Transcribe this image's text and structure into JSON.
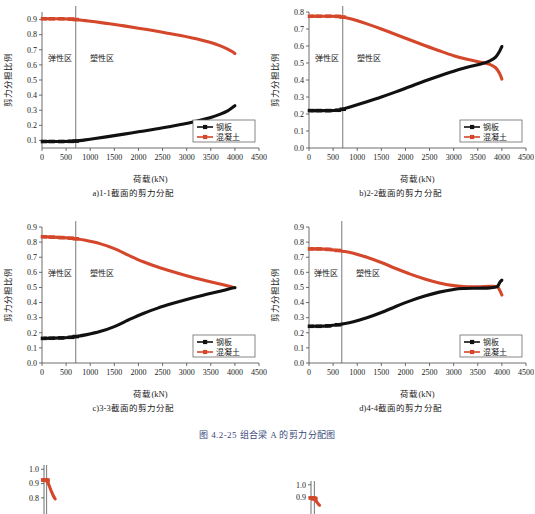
{
  "figure": {
    "caption": "图 4.2-25  组合梁 A 的剪力分配图",
    "axis": {
      "xlabel": "荷载(kN)",
      "ylabel": "剪力分担比例"
    },
    "zones": {
      "elastic": "弹性区",
      "plastic": "塑性区"
    },
    "legend": {
      "steel": "钢板",
      "concrete": "混凝土"
    },
    "colors": {
      "steel": "#111111",
      "concrete": "#D4472B",
      "axis": "#4a4a4a",
      "caption": "#3b4a7a"
    }
  },
  "chart_data": [
    {
      "id": "a",
      "type": "line",
      "title": "a)1-1截面的剪力分配",
      "xlabel": "荷载(kN)",
      "ylabel": "剪力分担比例",
      "xlim": [
        0,
        4500
      ],
      "ylim": [
        0.05,
        0.95
      ],
      "xticks": [
        0,
        500,
        1000,
        1500,
        2000,
        2500,
        3000,
        3500,
        4000,
        4500
      ],
      "yticks": [
        0.1,
        0.2,
        0.3,
        0.4,
        0.5,
        0.6,
        0.7,
        0.8,
        0.9
      ],
      "grid": false,
      "legend_position": "lower-right",
      "elastic_plastic_boundary": 700,
      "annotations": [
        "弹性区",
        "塑性区"
      ],
      "series": [
        {
          "name": "混凝土",
          "color": "#D4472B",
          "x": [
            40,
            200,
            400,
            600,
            700,
            900,
            1100,
            1400,
            1700,
            2000,
            2300,
            2600,
            2900,
            3200,
            3500,
            3700,
            3850,
            3950,
            4000
          ],
          "values": [
            0.905,
            0.905,
            0.905,
            0.903,
            0.9,
            0.893,
            0.885,
            0.872,
            0.858,
            0.843,
            0.827,
            0.81,
            0.793,
            0.773,
            0.748,
            0.726,
            0.705,
            0.687,
            0.675
          ]
        },
        {
          "name": "钢板",
          "color": "#111111",
          "x": [
            40,
            200,
            400,
            600,
            700,
            900,
            1100,
            1400,
            1700,
            2000,
            2300,
            2600,
            2900,
            3200,
            3500,
            3700,
            3850,
            3950,
            4000
          ],
          "values": [
            0.093,
            0.093,
            0.093,
            0.094,
            0.096,
            0.104,
            0.113,
            0.127,
            0.142,
            0.157,
            0.172,
            0.189,
            0.207,
            0.227,
            0.252,
            0.274,
            0.296,
            0.318,
            0.33
          ]
        }
      ]
    },
    {
      "id": "b",
      "type": "line",
      "title": "b)2-2截面的剪力分配",
      "xlabel": "荷载(kN)",
      "ylabel": "剪力分担比例",
      "xlim": [
        0,
        4500
      ],
      "ylim": [
        0.0,
        0.8
      ],
      "xticks": [
        0,
        500,
        1000,
        1500,
        2000,
        2500,
        3000,
        3500,
        4000,
        4500
      ],
      "yticks": [
        0.0,
        0.1,
        0.2,
        0.3,
        0.4,
        0.5,
        0.6,
        0.7,
        0.8
      ],
      "grid": false,
      "legend_position": "lower-right",
      "elastic_plastic_boundary": 700,
      "annotations": [
        "弹性区",
        "塑性区"
      ],
      "series": [
        {
          "name": "混凝土",
          "color": "#D4472B",
          "x": [
            40,
            200,
            400,
            600,
            700,
            900,
            1200,
            1500,
            1800,
            2100,
            2400,
            2700,
            3000,
            3300,
            3600,
            3750,
            3870,
            3950,
            4000
          ],
          "values": [
            0.775,
            0.775,
            0.775,
            0.774,
            0.77,
            0.757,
            0.73,
            0.7,
            0.668,
            0.635,
            0.603,
            0.572,
            0.543,
            0.52,
            0.503,
            0.492,
            0.472,
            0.44,
            0.405
          ]
        },
        {
          "name": "钢板",
          "color": "#111111",
          "x": [
            40,
            200,
            400,
            600,
            700,
            900,
            1200,
            1500,
            1800,
            2100,
            2400,
            2700,
            3000,
            3300,
            3600,
            3750,
            3870,
            3950,
            4000
          ],
          "values": [
            0.22,
            0.22,
            0.22,
            0.222,
            0.228,
            0.245,
            0.272,
            0.3,
            0.33,
            0.362,
            0.394,
            0.424,
            0.452,
            0.476,
            0.497,
            0.512,
            0.535,
            0.568,
            0.597
          ]
        }
      ]
    },
    {
      "id": "c",
      "type": "line",
      "title": "c)3-3截面的剪力分配",
      "xlabel": "荷载(kN)",
      "ylabel": "剪力分担比例",
      "xlim": [
        0,
        4500
      ],
      "ylim": [
        0.0,
        0.9
      ],
      "xticks": [
        0,
        500,
        1000,
        1500,
        2000,
        2500,
        3000,
        3500,
        4000,
        4500
      ],
      "yticks": [
        0.0,
        0.1,
        0.2,
        0.3,
        0.4,
        0.5,
        0.6,
        0.7,
        0.8,
        0.9
      ],
      "grid": false,
      "legend_position": "lower-right",
      "elastic_plastic_boundary": 700,
      "annotations": [
        "弹性区",
        "塑性区"
      ],
      "series": [
        {
          "name": "混凝土",
          "color": "#D4472B",
          "x": [
            40,
            200,
            400,
            600,
            700,
            900,
            1200,
            1500,
            1800,
            2100,
            2400,
            2700,
            3000,
            3300,
            3600,
            3800,
            3950,
            4000
          ],
          "values": [
            0.835,
            0.833,
            0.83,
            0.826,
            0.822,
            0.812,
            0.79,
            0.757,
            0.712,
            0.67,
            0.635,
            0.605,
            0.578,
            0.553,
            0.53,
            0.515,
            0.502,
            0.5
          ]
        },
        {
          "name": "钢板",
          "color": "#111111",
          "x": [
            40,
            200,
            400,
            600,
            700,
            900,
            1200,
            1500,
            1800,
            2100,
            2400,
            2700,
            3000,
            3300,
            3600,
            3800,
            3950,
            4000
          ],
          "values": [
            0.163,
            0.164,
            0.166,
            0.17,
            0.175,
            0.186,
            0.208,
            0.241,
            0.286,
            0.328,
            0.363,
            0.393,
            0.42,
            0.445,
            0.468,
            0.483,
            0.496,
            0.498
          ]
        }
      ]
    },
    {
      "id": "d",
      "type": "line",
      "title": "d)4-4截面的剪力分配",
      "xlabel": "荷载(kN)",
      "ylabel": "剪力分担比例",
      "xlim": [
        0,
        4500
      ],
      "ylim": [
        0.0,
        0.9
      ],
      "xticks": [
        0,
        500,
        1000,
        1500,
        2000,
        2500,
        3000,
        3500,
        4000,
        4500
      ],
      "yticks": [
        0.0,
        0.1,
        0.2,
        0.3,
        0.4,
        0.5,
        0.6,
        0.7,
        0.8,
        0.9
      ],
      "grid": false,
      "legend_position": "lower-right",
      "elastic_plastic_boundary": 680,
      "annotations": [
        "弹性区",
        "塑性区"
      ],
      "series": [
        {
          "name": "混凝土",
          "color": "#D4472B",
          "x": [
            40,
            200,
            400,
            600,
            700,
            900,
            1200,
            1500,
            1800,
            2100,
            2400,
            2700,
            3000,
            3200,
            3500,
            3750,
            3900,
            3960,
            4000
          ],
          "values": [
            0.755,
            0.755,
            0.752,
            0.745,
            0.74,
            0.728,
            0.7,
            0.665,
            0.625,
            0.588,
            0.556,
            0.53,
            0.512,
            0.506,
            0.505,
            0.508,
            0.505,
            0.478,
            0.45
          ]
        },
        {
          "name": "钢板",
          "color": "#111111",
          "x": [
            40,
            200,
            400,
            600,
            700,
            900,
            1200,
            1500,
            1800,
            2100,
            2400,
            2700,
            3000,
            3200,
            3500,
            3750,
            3900,
            3960,
            4000
          ],
          "values": [
            0.243,
            0.243,
            0.246,
            0.253,
            0.259,
            0.271,
            0.299,
            0.334,
            0.374,
            0.411,
            0.443,
            0.469,
            0.487,
            0.493,
            0.495,
            0.497,
            0.505,
            0.535,
            0.548
          ]
        }
      ]
    }
  ],
  "bottom_charts": [
    {
      "id": "bottom-left",
      "type": "line",
      "yticks": [
        1.0,
        0.9,
        0.8
      ],
      "ylim": [
        0.75,
        1.03
      ],
      "xlim": [
        0,
        4500
      ],
      "elastic_plastic_boundary": 700,
      "series": [
        {
          "name": "混凝土",
          "color": "#D4472B",
          "x": [
            40,
            200,
            400,
            600,
            700,
            900,
            1200,
            1500,
            1800,
            2100,
            2400,
            2700,
            3000
          ],
          "values": [
            0.925,
            0.925,
            0.924,
            0.923,
            0.922,
            0.915,
            0.898,
            0.878,
            0.857,
            0.838,
            0.82,
            0.805,
            0.793
          ]
        }
      ]
    },
    {
      "id": "bottom-right",
      "type": "line",
      "yticks": [
        1.0,
        0.9
      ],
      "ylim": [
        0.82,
        1.03
      ],
      "xlim": [
        0,
        4500
      ],
      "elastic_plastic_boundary": 900,
      "series": [
        {
          "name": "混凝土",
          "color": "#D4472B",
          "x": [
            200,
            400,
            600,
            800,
            900,
            1100,
            1400,
            1700,
            2000,
            2300
          ],
          "values": [
            0.892,
            0.892,
            0.891,
            0.889,
            0.886,
            0.878,
            0.866,
            0.854,
            0.843,
            0.834
          ]
        }
      ]
    }
  ]
}
